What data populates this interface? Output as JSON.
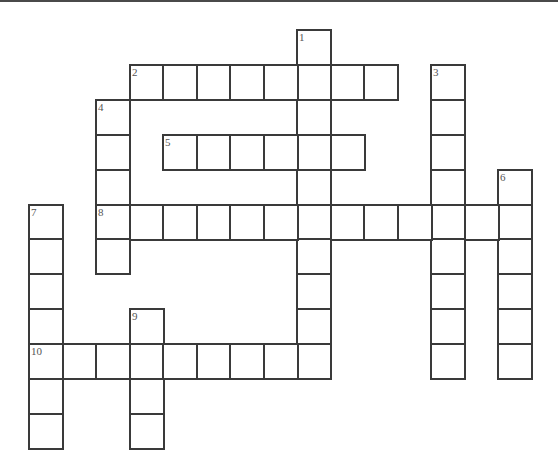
{
  "puzzle": {
    "type": "crossword",
    "grid": {
      "origin_x": 29,
      "origin_y": 30,
      "cell_width": 33.5,
      "cell_height": 34.9,
      "cols": 15,
      "rows": 12
    },
    "entries": [
      {
        "number": "1",
        "direction": "down",
        "row": 0,
        "col": 8,
        "length": 10
      },
      {
        "number": "2",
        "direction": "across",
        "row": 1,
        "col": 3,
        "length": 8
      },
      {
        "number": "3",
        "direction": "down",
        "row": 1,
        "col": 12,
        "length": 9
      },
      {
        "number": "4",
        "direction": "down",
        "row": 2,
        "col": 2,
        "length": 5
      },
      {
        "number": "5",
        "direction": "across",
        "row": 3,
        "col": 4,
        "length": 6
      },
      {
        "number": "6",
        "direction": "down",
        "row": 4,
        "col": 14,
        "length": 6
      },
      {
        "number": "7",
        "direction": "down",
        "row": 5,
        "col": 0,
        "length": 7
      },
      {
        "number": "8",
        "direction": "across",
        "row": 5,
        "col": 2,
        "length": 13
      },
      {
        "number": "9",
        "direction": "down",
        "row": 8,
        "col": 3,
        "length": 4
      },
      {
        "number": "10",
        "direction": "across",
        "row": 9,
        "col": 0,
        "length": 9
      }
    ],
    "colors": {
      "line": "#3a3a3a",
      "cell_fill": "#ffffff",
      "number_text": "#555555"
    }
  }
}
